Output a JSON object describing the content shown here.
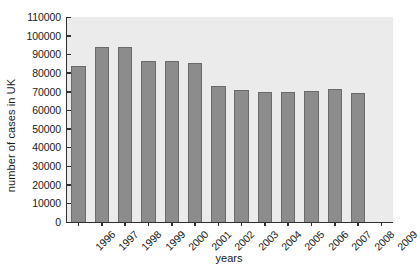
{
  "chart_data": {
    "type": "bar",
    "title": "",
    "xlabel": "years",
    "ylabel": "number of cases in UK",
    "categories": [
      "1996",
      "1997",
      "1998",
      "1999",
      "2000",
      "2001",
      "2002",
      "2003",
      "2004",
      "2005",
      "2006",
      "2007",
      "2008",
      "2009"
    ],
    "values": [
      83500,
      94000,
      94000,
      86500,
      86500,
      85500,
      73000,
      71000,
      70000,
      70000,
      70500,
      71500,
      69000,
      null
    ],
    "ylim": [
      0,
      110000
    ],
    "ytick_step": 10000,
    "yticks": [
      {
        "value": 110000,
        "label": "110000"
      },
      {
        "value": 100000,
        "label": "100000"
      },
      {
        "value": 90000,
        "label": "90000"
      },
      {
        "value": 80000,
        "label": "80000"
      },
      {
        "value": 70000,
        "label": "70000"
      },
      {
        "value": 60000,
        "label": "60000"
      },
      {
        "value": 50000,
        "label": "50000"
      },
      {
        "value": 40000,
        "label": "40000"
      },
      {
        "value": 30000,
        "label": "30000"
      },
      {
        "value": 20000,
        "label": "20000"
      },
      {
        "value": 10000,
        "label": "10000"
      },
      {
        "value": 0,
        "label": "0"
      }
    ],
    "grid": false,
    "legend": false,
    "legend_position": "none",
    "colors": {
      "bar_fill": "#8c8c8c",
      "bar_edge": "#6a6a6a",
      "plot_background": "#ebebeb",
      "axis": "#303030",
      "figure_background": "#ffffff",
      "text": "#1a1a1a"
    }
  }
}
